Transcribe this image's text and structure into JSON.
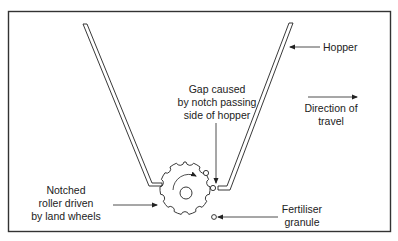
{
  "diagram": {
    "labels": {
      "hopper": "Hopper",
      "gap_line1": "Gap caused",
      "gap_line2": "by notch passing",
      "gap_line3": "side of hopper",
      "direction_line1": "Direction of",
      "direction_line2": "travel",
      "roller_line1": "Notched",
      "roller_line2": "roller driven",
      "roller_line3": "by land wheels",
      "granule_line1": "Fertiliser",
      "granule_line2": "granule"
    },
    "colors": {
      "line": "#222222",
      "frame": "#333333",
      "background": "#ffffff"
    }
  }
}
